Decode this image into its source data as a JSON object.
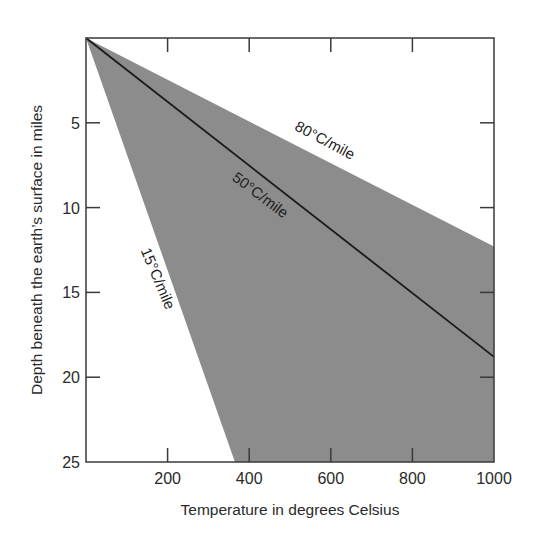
{
  "chart_data": {
    "type": "area",
    "title": "",
    "xlabel": "Temperature in degrees Celsius",
    "ylabel": "Depth beneath the earth’s surface in miles",
    "xlim": [
      0,
      1000
    ],
    "ylim": [
      0,
      25
    ],
    "y_inverted": true,
    "grid": false,
    "x_ticks": [
      200,
      400,
      600,
      800,
      1000
    ],
    "y_ticks": [
      5,
      10,
      15,
      20,
      25
    ],
    "shaded_region": {
      "description": "Range of geothermal gradients between 15°C/mile and 80°C/mile",
      "color": "#8c8c8c",
      "polygon": [
        [
          0,
          0
        ],
        [
          1000,
          12.3
        ],
        [
          1000,
          25
        ],
        [
          365,
          25
        ]
      ]
    },
    "series": [
      {
        "name": "80°C/mile",
        "role": "upper boundary",
        "x": [
          0,
          1000
        ],
        "y": [
          0,
          12.3
        ]
      },
      {
        "name": "50°C/mile",
        "role": "center line",
        "x": [
          0,
          1000
        ],
        "y": [
          0,
          18.8
        ]
      },
      {
        "name": "15°C/mile",
        "role": "lower boundary",
        "x": [
          0,
          365
        ],
        "y": [
          0,
          25
        ]
      }
    ],
    "annotations": [
      {
        "text": "80°C/mile",
        "x": 580,
        "y": 6.3,
        "angle": 28
      },
      {
        "text": "50°C/mile",
        "x": 420,
        "y": 9.5,
        "angle": 37
      },
      {
        "text": "15°C/mile",
        "x": 165,
        "y": 14.3,
        "angle": 67
      }
    ]
  },
  "axes": {
    "x_title": "Temperature in degrees Celsius",
    "y_title": "Depth beneath the earth’s surface in miles"
  },
  "colors": {
    "band": "#8c8c8c",
    "axis": "#3a3a3a",
    "line": "#1a1a1a",
    "text": "#2a2a2a"
  }
}
